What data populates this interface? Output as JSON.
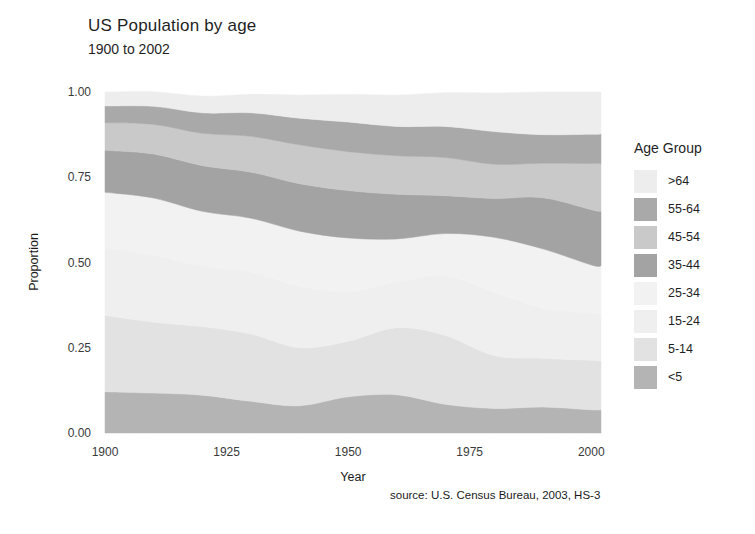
{
  "title": "US Population by age",
  "subtitle": "1900 to 2002",
  "caption": "source: U.S. Census Bureau, 2003, HS-3",
  "legend": {
    "title": "Age Group",
    "items": [
      {
        "label": ">64",
        "color": "#ededed"
      },
      {
        "label": "55-64",
        "color": "#a9a9a9"
      },
      {
        "label": "45-54",
        "color": "#c9c9c9"
      },
      {
        "label": "35-44",
        "color": "#a3a3a3"
      },
      {
        "label": "25-34",
        "color": "#f2f2f2"
      },
      {
        "label": "15-24",
        "color": "#efefef"
      },
      {
        "label": "5-14",
        "color": "#e2e2e2"
      },
      {
        "label": "<5",
        "color": "#b4b4b4"
      }
    ]
  },
  "chart_data": {
    "type": "area",
    "title": "US Population by age",
    "subtitle": "1900 to 2002",
    "xlabel": "Year",
    "ylabel": "Proportion",
    "xlim": [
      1900,
      2002
    ],
    "ylim": [
      0,
      1
    ],
    "xticks": [
      1900,
      1925,
      1950,
      1975,
      2000
    ],
    "yticks": [
      0.0,
      0.25,
      0.5,
      0.75,
      1.0
    ],
    "ytick_labels": [
      "0.00",
      "0.25",
      "0.50",
      "0.75",
      "1.00"
    ],
    "grid": false,
    "legend_position": "right",
    "stacked": true,
    "stack_order_bottom_to_top": [
      "<5",
      "5-14",
      "15-24",
      "25-34",
      "35-44",
      "45-54",
      "55-64",
      ">64"
    ],
    "x": [
      1900,
      1910,
      1920,
      1930,
      1940,
      1950,
      1960,
      1970,
      1980,
      1990,
      2000,
      2002
    ],
    "series": [
      {
        "name": "<5",
        "color": "#b4b4b4",
        "values": [
          0.121,
          0.117,
          0.111,
          0.093,
          0.08,
          0.106,
          0.112,
          0.084,
          0.072,
          0.076,
          0.068,
          0.068
        ]
      },
      {
        "name": "5-14",
        "color": "#e2e2e2",
        "values": [
          0.224,
          0.208,
          0.201,
          0.197,
          0.17,
          0.163,
          0.197,
          0.202,
          0.155,
          0.143,
          0.145,
          0.143
        ]
      },
      {
        "name": "15-24",
        "color": "#efefef",
        "values": [
          0.199,
          0.197,
          0.178,
          0.183,
          0.181,
          0.146,
          0.134,
          0.175,
          0.186,
          0.148,
          0.139,
          0.139
        ]
      },
      {
        "name": "25-34",
        "color": "#f2f2f2",
        "values": [
          0.162,
          0.167,
          0.16,
          0.157,
          0.161,
          0.157,
          0.126,
          0.124,
          0.161,
          0.173,
          0.141,
          0.14
        ]
      },
      {
        "name": "35-44",
        "color": "#a3a3a3",
        "values": [
          0.123,
          0.129,
          0.134,
          0.135,
          0.139,
          0.139,
          0.131,
          0.111,
          0.114,
          0.15,
          0.162,
          0.16
        ]
      },
      {
        "name": "45-54",
        "color": "#c9c9c9",
        "values": [
          0.081,
          0.087,
          0.095,
          0.105,
          0.114,
          0.114,
          0.113,
          0.112,
          0.1,
          0.101,
          0.135,
          0.139
        ]
      },
      {
        "name": "55-64",
        "color": "#a9a9a9",
        "values": [
          0.049,
          0.053,
          0.06,
          0.069,
          0.078,
          0.087,
          0.086,
          0.091,
          0.096,
          0.084,
          0.086,
          0.088
        ]
      },
      {
        "name": ">64",
        "color": "#ededed",
        "values": [
          0.041,
          0.043,
          0.049,
          0.054,
          0.068,
          0.081,
          0.092,
          0.099,
          0.113,
          0.125,
          0.124,
          0.123
        ]
      }
    ],
    "series_percent_1900": {
      "<5": 12.1,
      "5-14": 22.4,
      "15-24": 19.9,
      "25-34": 16.2,
      "35-44": 12.3,
      "45-54": 8.1,
      "55-64": 4.9,
      ">64": 4.1
    },
    "series_percent_2000": {
      "<5": 6.8,
      "5-14": 14.5,
      "15-24": 13.9,
      "25-34": 14.1,
      "35-44": 16.2,
      "45-54": 13.5,
      "55-64": 8.6,
      ">64": 12.4
    }
  },
  "plot": {
    "left": 105,
    "top": 92,
    "width": 496,
    "height": 341
  }
}
